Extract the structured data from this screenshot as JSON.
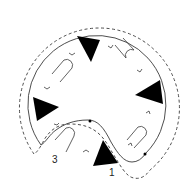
{
  "diagram": {
    "type": "mechanical-schematic",
    "colors": {
      "stroke": "#3a3a3a",
      "fill": "#000000",
      "background": "#ffffff"
    },
    "labels": [
      {
        "id": "label-1",
        "text": "1"
      },
      {
        "id": "label-3",
        "text": "3"
      }
    ],
    "elements": {
      "solid_outline": "solid closed contour",
      "dashed_outline": "dashed outer contour",
      "triangles": 5,
      "u_loops": 4,
      "chevrons": 10,
      "dots": 2
    }
  }
}
